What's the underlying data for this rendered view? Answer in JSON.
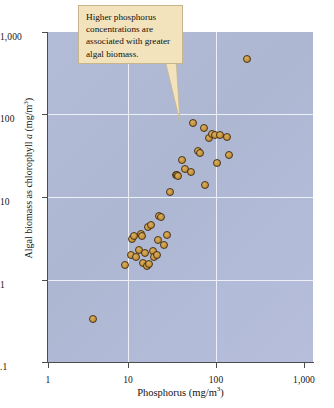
{
  "figure": {
    "background_color": "#ffffff",
    "plot_background_color": "#b0bad5",
    "gridline_color": "#edf0f7",
    "point_fill_color": "#c8963f",
    "point_edge_color": "#4a3415",
    "callout_fill_color": "#f2e3bd",
    "callout_border_color": "#c7b48b"
  },
  "callout": {
    "text": "Higher phosphorus concentrations are associated with greater algal biomass.",
    "line1": "Higher phosphorus",
    "line2": "concentrations are",
    "line3": "associated with greater",
    "line4": "algal biomass.",
    "target_point": {
      "x": 55,
      "y": 75
    }
  },
  "chart_data": {
    "type": "scatter",
    "title": "",
    "xlabel": "Phosphorus (mg/m",
    "xlabel_sup": "3",
    "xlabel_tail": ")",
    "xlabel_full": "Phosphorus (mg/m3)",
    "ylabel_pre": "Algal biomass as chlorophyll ",
    "ylabel_ital": "a",
    "ylabel_post": " (mg/m",
    "ylabel_sup": "3",
    "ylabel_tail": ")",
    "ylabel_full": "Algal biomass as chlorophyll a (mg/m3)",
    "xscale": "log",
    "yscale": "log",
    "xlim": [
      1,
      1000
    ],
    "ylim": [
      0.1,
      1000
    ],
    "grid": true,
    "legend": null,
    "xticks": [
      {
        "value": 1,
        "label": "1"
      },
      {
        "value": 10,
        "label": "10"
      },
      {
        "value": 100,
        "label": "100"
      },
      {
        "value": 1000,
        "label": "1,000"
      }
    ],
    "yticks": [
      {
        "value": 0.1,
        "label": ".1"
      },
      {
        "value": 1,
        "label": "1"
      },
      {
        "value": 10,
        "label": "10"
      },
      {
        "value": 100,
        "label": "100"
      },
      {
        "value": 1000,
        "label": "1,000"
      }
    ],
    "series": [
      {
        "name": "lake samples",
        "marker": "circle",
        "points": [
          {
            "x": 3.2,
            "y": 0.33
          },
          {
            "x": 7.4,
            "y": 1.5
          },
          {
            "x": 8.6,
            "y": 2.0
          },
          {
            "x": 9.0,
            "y": 3.1
          },
          {
            "x": 9.4,
            "y": 3.4
          },
          {
            "x": 10.0,
            "y": 1.9
          },
          {
            "x": 10.6,
            "y": 2.3
          },
          {
            "x": 11.2,
            "y": 3.6
          },
          {
            "x": 11.6,
            "y": 3.4
          },
          {
            "x": 12.0,
            "y": 1.6
          },
          {
            "x": 12.6,
            "y": 2.1
          },
          {
            "x": 13.2,
            "y": 1.45
          },
          {
            "x": 13.6,
            "y": 4.3
          },
          {
            "x": 14.0,
            "y": 1.55
          },
          {
            "x": 14.6,
            "y": 4.6
          },
          {
            "x": 15.6,
            "y": 2.2
          },
          {
            "x": 16.0,
            "y": 1.85
          },
          {
            "x": 17.0,
            "y": 2.0
          },
          {
            "x": 17.6,
            "y": 3.0
          },
          {
            "x": 18.2,
            "y": 5.9
          },
          {
            "x": 19.0,
            "y": 5.8
          },
          {
            "x": 20.5,
            "y": 2.6
          },
          {
            "x": 22.0,
            "y": 3.5
          },
          {
            "x": 24.0,
            "y": 11.5
          },
          {
            "x": 28.0,
            "y": 18.5
          },
          {
            "x": 29.0,
            "y": 18.5
          },
          {
            "x": 30.0,
            "y": 18.0
          },
          {
            "x": 33.0,
            "y": 28.0
          },
          {
            "x": 36.0,
            "y": 22.0
          },
          {
            "x": 42.0,
            "y": 20.0
          },
          {
            "x": 44.0,
            "y": 78.0
          },
          {
            "x": 50.0,
            "y": 36.0
          },
          {
            "x": 52.0,
            "y": 34.0
          },
          {
            "x": 58.0,
            "y": 68.0
          },
          {
            "x": 60.0,
            "y": 14.0
          },
          {
            "x": 66.0,
            "y": 52.0
          },
          {
            "x": 72.0,
            "y": 58.0
          },
          {
            "x": 78.0,
            "y": 57.0
          },
          {
            "x": 82.0,
            "y": 26.0
          },
          {
            "x": 88.0,
            "y": 56.0
          },
          {
            "x": 105.0,
            "y": 53.0
          },
          {
            "x": 112.0,
            "y": 32.0
          },
          {
            "x": 180.0,
            "y": 470.0
          }
        ]
      }
    ]
  }
}
